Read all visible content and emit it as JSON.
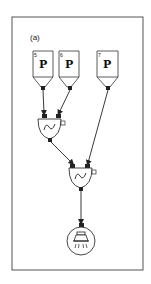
{
  "panel_label": "(a)",
  "sources": [
    {
      "id": "source-5",
      "number": "5",
      "letter": "P"
    },
    {
      "id": "source-6",
      "number": "6",
      "letter": "P"
    },
    {
      "id": "source-7",
      "number": "7",
      "letter": "P"
    }
  ],
  "mixers": [
    {
      "id": "mixer-1",
      "symbol": "~",
      "inputs": [
        "source-5",
        "source-6"
      ]
    },
    {
      "id": "mixer-2",
      "symbol": "~",
      "inputs": [
        "mixer-1",
        "source-7"
      ]
    }
  ],
  "output": {
    "id": "light-output",
    "icon": "lamp-icon",
    "input": "mixer-2"
  },
  "colors": {
    "stroke": "#333333",
    "background": "#ffffff"
  }
}
